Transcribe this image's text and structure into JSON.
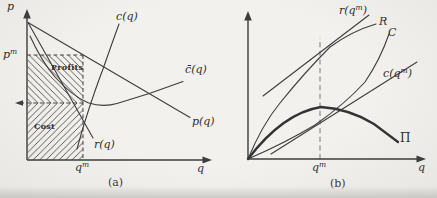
{
  "figure": {
    "panel_a": {
      "caption": "(a)",
      "y_axis_label": "p",
      "x_axis_label": "q",
      "monopoly_price": {
        "base": "p",
        "sup": "m"
      },
      "monopoly_quantity": {
        "base": "q",
        "sup": "m"
      },
      "marginal_cost_label": "c(q)",
      "average_cost_label": "c̄(q)",
      "demand_label": "p(q)",
      "marginal_revenue_label": "r(q)",
      "profit_region_label": "Profits",
      "cost_region_label": "Cost"
    },
    "panel_b": {
      "caption": "(b)",
      "x_axis_label": "q",
      "monopoly_quantity": {
        "base": "q",
        "sup": "m"
      },
      "revenue_tangent_label": {
        "pre": "r(q",
        "sup": "m",
        "post": ")"
      },
      "revenue_label": "R",
      "total_cost_label": "C",
      "cost_tangent_label": {
        "pre": "c(q",
        "sup": "m",
        "post": ")"
      },
      "profit_label": "Π"
    },
    "colors": {
      "ink": "#3d3d3d",
      "paper": "#efeeea",
      "hatch": "#4a4a4a",
      "dash_gray": "#8a8a8a"
    }
  }
}
